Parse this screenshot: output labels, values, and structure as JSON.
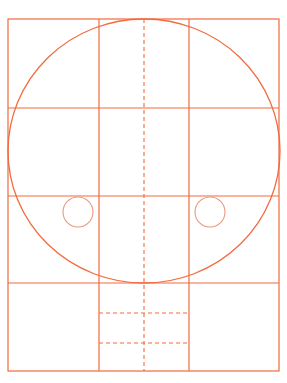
{
  "diagram": {
    "type": "construction-grid",
    "colors": {
      "stroke": "#f26a3d",
      "small_circle": "#e89a80",
      "background": "#ffffff"
    },
    "outer_rect": {
      "x": 8,
      "y": 19,
      "width": 271,
      "height": 352
    },
    "vertical_lines": [
      99,
      189
    ],
    "horizontal_lines": [
      108,
      196,
      283
    ],
    "center_dashed_x": 144,
    "dashed_horizontals": [
      {
        "y": 313,
        "x1": 99,
        "x2": 189
      },
      {
        "y": 343,
        "x1": 99,
        "x2": 189
      }
    ],
    "big_circle": {
      "cx": 144,
      "cy": 151,
      "rx": 136,
      "ry": 132
    },
    "small_circles": [
      {
        "cx": 78,
        "cy": 212,
        "r": 15
      },
      {
        "cx": 210,
        "cy": 212,
        "r": 15
      }
    ]
  }
}
